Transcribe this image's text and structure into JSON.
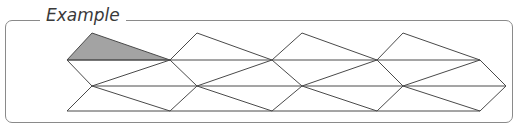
{
  "title": "Example",
  "colors": {
    "stroke": "#4a4a4a",
    "shaded": "#a3a3a3",
    "frame": "#8a8a8a"
  },
  "diagram": {
    "shaded_triangle": [
      [
        92,
        33
      ],
      [
        67,
        60
      ],
      [
        170,
        60
      ]
    ],
    "horizontal_lines": [
      {
        "y": 60,
        "x1": 67,
        "x2": 480
      },
      {
        "y": 86,
        "x1": 92,
        "x2": 506
      },
      {
        "y": 111,
        "x1": 67,
        "x2": 480
      }
    ]
  }
}
